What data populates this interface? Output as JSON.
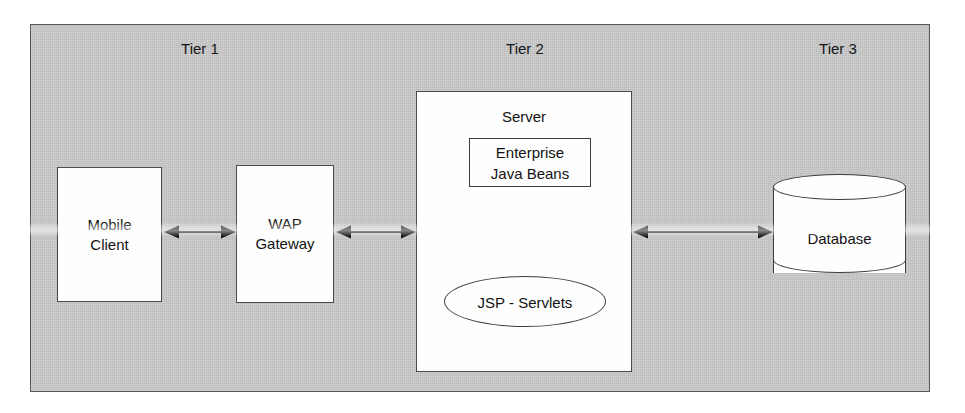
{
  "diagram": {
    "tiers": [
      {
        "label": "Tier 1",
        "left": 130,
        "width": 140
      },
      {
        "label": "Tier 2",
        "left": 455,
        "width": 140
      },
      {
        "label": "Tier 3",
        "left": 768,
        "width": 140
      }
    ],
    "nodes": {
      "mobile_client": "Mobile\nClient",
      "wap_gateway": "WAP\nGateway",
      "server_title": "Server",
      "enterprise_java_beans": "Enterprise\nJava Beans",
      "jsp_servlets": "JSP - Servlets",
      "database": "Database"
    },
    "connectors": [
      {
        "name": "mobile-client-to-wap-gateway",
        "direction": "bidirectional"
      },
      {
        "name": "wap-gateway-to-server",
        "direction": "bidirectional"
      },
      {
        "name": "server-to-database",
        "direction": "bidirectional"
      }
    ],
    "colors": {
      "panel_background": "#c9c9c9",
      "node_fill": "#fefefe",
      "stroke": "#3d3d3d",
      "text": "#121212"
    }
  }
}
